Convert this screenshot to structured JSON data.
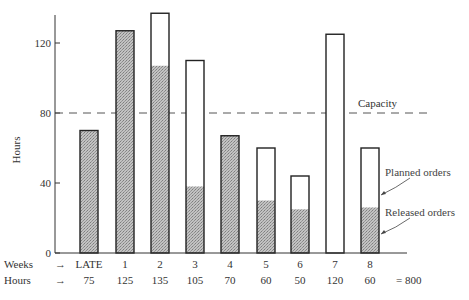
{
  "chart_data": {
    "type": "bar",
    "subtype": "stacked",
    "title": "",
    "xlabel": "Weeks",
    "ylabel": "Hours",
    "ylim": [
      0,
      140
    ],
    "yticks": [
      0,
      40,
      80,
      120
    ],
    "grid": false,
    "categories": [
      "LATE",
      "1",
      "2",
      "3",
      "4",
      "5",
      "6",
      "7",
      "8"
    ],
    "series": [
      {
        "name": "Released orders",
        "fill": "hatched-gray",
        "values": [
          70,
          127,
          107,
          38,
          67,
          30,
          25,
          0,
          26
        ]
      },
      {
        "name": "Planned orders",
        "fill": "white",
        "values": [
          0,
          0,
          30,
          72,
          0,
          30,
          19,
          125,
          34
        ]
      }
    ],
    "totals": [
      70,
      127,
      137,
      110,
      67,
      60,
      44,
      125,
      60
    ],
    "reference_line": {
      "label": "Capacity",
      "value": 80,
      "style": "dashed"
    },
    "annotations": [
      {
        "text": "Planned orders",
        "points_to": "white (upper) portion of week 8 bar"
      },
      {
        "text": "Released orders",
        "points_to": "gray (lower) portion of week 8 bar"
      }
    ],
    "table_rows": {
      "weeks_label": "Weeks",
      "hours_label": "Hours",
      "hours_values": [
        "75",
        "125",
        "135",
        "105",
        "70",
        "60",
        "50",
        "120",
        "60"
      ],
      "total": "= 800"
    }
  },
  "labels": {
    "y_axis": "Hours",
    "capacity": "Capacity",
    "planned": "Planned orders",
    "released": "Released orders",
    "weeks": "Weeks",
    "hours": "Hours",
    "arrow": "→",
    "total": "= 800"
  },
  "colors": {
    "axis": "#333333",
    "bar_outline": "#222222",
    "hatch_base": "#b8b8b8",
    "hatch_dot": "#8a8a8a",
    "capacity_line": "#555555"
  }
}
